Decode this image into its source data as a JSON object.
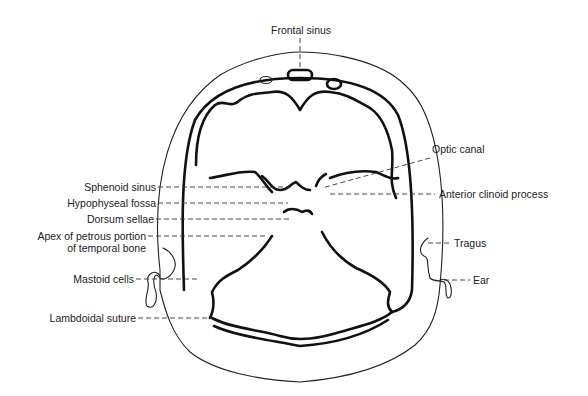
{
  "figure": {
    "labels": {
      "frontal_sinus": "Frontal sinus",
      "optic_canal": "Optic canal",
      "sphenoid_sinus": "Sphenoid sinus",
      "anterior_clinoid_process": "Anterior clinoid process",
      "hypophyseal_fossa": "Hypophyseal fossa",
      "dorsum_sellae": "Dorsum sellae",
      "apex_petrous_line1": "Apex of petrous portion",
      "apex_petrous_line2": "of temporal bone",
      "tragus": "Tragus",
      "mastoid_cells": "Mastoid cells",
      "ear": "Ear",
      "lambdoidal_suture": "Lambdoidal suture"
    }
  }
}
